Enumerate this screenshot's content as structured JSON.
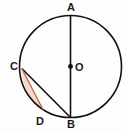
{
  "figure": {
    "width": 127,
    "height": 133,
    "background_color": "#fdfdfd"
  },
  "colors": {
    "stroke": "#111111",
    "chord_cd": "#b5614a",
    "segment_fill": "#f2c9bb",
    "label_text": "#1a1a1a"
  },
  "circle": {
    "center_x": 70.5,
    "center_y": 66.5,
    "radius": 51,
    "stroke_width": 1.6
  },
  "points": {
    "A": {
      "label": "A",
      "x": 70.5,
      "y": 15.5,
      "label_x": 67,
      "label_y": 2
    },
    "B": {
      "label": "B",
      "x": 70.5,
      "y": 117.5,
      "label_x": 67,
      "label_y": 119
    },
    "C": {
      "label": "C",
      "x": 21.8,
      "y": 68.5,
      "label_x": 10,
      "label_y": 61
    },
    "D": {
      "label": "D",
      "x": 43.5,
      "y": 110.5,
      "label_x": 36,
      "label_y": 116
    },
    "O": {
      "label": "O",
      "x": 70.5,
      "y": 66.5,
      "label_x": 75,
      "label_y": 62
    }
  },
  "segments": [
    {
      "name": "diameter-AB",
      "from": "A",
      "to": "B",
      "color": "#111111",
      "width": 1.6
    },
    {
      "name": "chord-CB",
      "from": "C",
      "to": "B",
      "color": "#111111",
      "width": 1.6
    },
    {
      "name": "chord-CD",
      "from": "C",
      "to": "D",
      "color": "#b5614a",
      "width": 1.2
    }
  ],
  "shaded_region": {
    "name": "circular-segment-CD",
    "description": "Region bounded by chord CD and minor arc CD",
    "fill": "#f2c9bb",
    "fill_opacity": 0.75
  },
  "center_dot": {
    "radius": 2.4,
    "color": "#111111"
  }
}
